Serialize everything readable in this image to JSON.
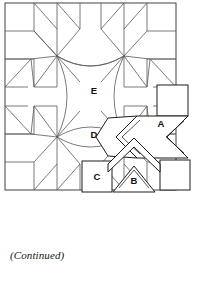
{
  "page": {
    "background_color": "#ffffff",
    "caption": "(Continued)",
    "width": 199,
    "height": 296
  },
  "diagram": {
    "name": "quilt-block-pattern-diagram",
    "title": "",
    "line_color": "#58585c",
    "template_line_color": "#1d1d20",
    "fill_color": "#ffffff",
    "block": {
      "left": 5,
      "top": 3,
      "right": 176,
      "bottom": 190
    },
    "labels": [
      {
        "id": "E",
        "text": "E",
        "x": 94,
        "y": 91,
        "description": "upper center curved patch"
      },
      {
        "id": "D",
        "text": "D",
        "x": 94,
        "y": 135,
        "description": "lower center curved patch"
      },
      {
        "id": "A",
        "text": "A",
        "x": 161,
        "y": 124,
        "description": "chevron template piece"
      },
      {
        "id": "B",
        "text": "B",
        "x": 134,
        "y": 181,
        "description": "triangle template piece"
      },
      {
        "id": "C",
        "text": "C",
        "x": 96,
        "y": 177,
        "description": "square template piece"
      }
    ],
    "template_pieces": [
      {
        "id": "A",
        "shape": "chevron"
      },
      {
        "id": "B",
        "shape": "triangle"
      },
      {
        "id": "C",
        "shape": "square"
      }
    ]
  }
}
